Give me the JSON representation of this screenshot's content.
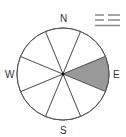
{
  "compass": {
    "directions": {
      "north": "N",
      "south": "S",
      "east": "E",
      "west": "W"
    },
    "sectors": 8,
    "highlighted_sector": "E",
    "highlight_color": "#999999",
    "line_color": "#555555"
  },
  "weather_symbol": {
    "name": "fog-symbol",
    "rows": [
      "dashed",
      "dashed",
      "solid"
    ]
  }
}
